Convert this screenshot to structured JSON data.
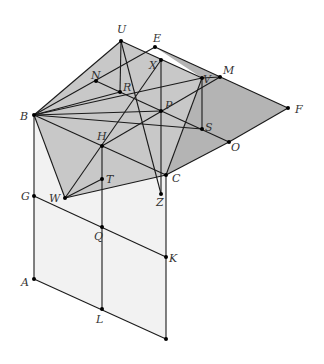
{
  "diagram": {
    "type": "3d-geometry-figure",
    "colors": {
      "line": "#1a1a1a",
      "upper_face": "#c8c8c8",
      "right_face": "#b4b4b4",
      "lower_face": "#f2f2f2",
      "point": "#000000",
      "label": "#333333"
    },
    "points": [
      {
        "id": "U",
        "x": 121,
        "y": 41,
        "lx": 117,
        "ly": 33
      },
      {
        "id": "E",
        "x": 155,
        "y": 47,
        "lx": 153,
        "ly": 42
      },
      {
        "id": "X",
        "x": 161,
        "y": 60,
        "lx": 149,
        "ly": 69
      },
      {
        "id": "N",
        "x": 96,
        "y": 81,
        "lx": 91,
        "ly": 79
      },
      {
        "id": "R",
        "x": 120,
        "y": 92,
        "lx": 123,
        "ly": 91
      },
      {
        "id": "V",
        "x": 202,
        "y": 78,
        "lx": 203,
        "ly": 83
      },
      {
        "id": "M",
        "x": 220,
        "y": 77,
        "lx": 223,
        "ly": 74
      },
      {
        "id": "B",
        "x": 34,
        "y": 115,
        "lx": 20,
        "ly": 120
      },
      {
        "id": "P",
        "x": 161,
        "y": 111,
        "lx": 165,
        "ly": 109
      },
      {
        "id": "F",
        "x": 288,
        "y": 108,
        "lx": 295,
        "ly": 113
      },
      {
        "id": "S",
        "x": 202,
        "y": 129,
        "lx": 205,
        "ly": 131
      },
      {
        "id": "O",
        "x": 229,
        "y": 142,
        "lx": 231,
        "ly": 151
      },
      {
        "id": "H",
        "x": 102,
        "y": 146,
        "lx": 97,
        "ly": 140
      },
      {
        "id": "C",
        "x": 166,
        "y": 175,
        "lx": 172,
        "ly": 182
      },
      {
        "id": "T",
        "x": 102,
        "y": 179,
        "lx": 106,
        "ly": 183
      },
      {
        "id": "W",
        "x": 65,
        "y": 198,
        "lx": 49,
        "ly": 202
      },
      {
        "id": "Z",
        "x": 161,
        "y": 194,
        "lx": 156,
        "ly": 206
      },
      {
        "id": "G",
        "x": 34,
        "y": 196,
        "lx": 21,
        "ly": 200
      },
      {
        "id": "Q",
        "x": 102,
        "y": 227,
        "lx": 94,
        "ly": 240
      },
      {
        "id": "K",
        "x": 166,
        "y": 257,
        "lx": 169,
        "ly": 262
      },
      {
        "id": "A",
        "x": 34,
        "y": 279,
        "lx": 21,
        "ly": 286
      },
      {
        "id": "L",
        "x": 102,
        "y": 309,
        "lx": 96,
        "ly": 323
      },
      {
        "id": "",
        "x": 166,
        "y": 339,
        "lx": 0,
        "ly": 0
      }
    ],
    "faces": [
      {
        "name": "lower-face",
        "pts": "34,115 34,279 166,339 166,175",
        "fill": "lower_face"
      },
      {
        "name": "right-face",
        "pts": "155,47 288,108 229,142 166,175 202,78",
        "fill": "right_face"
      },
      {
        "name": "upper-face",
        "pts": "121,41 202,78 166,175 65,198 34,115",
        "fill": "upper_face"
      }
    ],
    "segments": [
      [
        34,
        115,
        121,
        41
      ],
      [
        121,
        41,
        202,
        78
      ],
      [
        202,
        78,
        220,
        77
      ],
      [
        155,
        47,
        288,
        108
      ],
      [
        288,
        108,
        229,
        142
      ],
      [
        229,
        142,
        166,
        175
      ],
      [
        34,
        115,
        65,
        198
      ],
      [
        65,
        198,
        166,
        175
      ],
      [
        166,
        175,
        202,
        78
      ],
      [
        34,
        115,
        155,
        47
      ],
      [
        96,
        81,
        229,
        142
      ],
      [
        34,
        115,
        166,
        175
      ],
      [
        34,
        115,
        202,
        129
      ],
      [
        34,
        115,
        120,
        92
      ],
      [
        34,
        115,
        202,
        78
      ],
      [
        34,
        115,
        161,
        111
      ],
      [
        65,
        198,
        161,
        60
      ],
      [
        102,
        146,
        220,
        77
      ],
      [
        121,
        41,
        161,
        194
      ],
      [
        161,
        60,
        161,
        194
      ],
      [
        121,
        41,
        120,
        92
      ],
      [
        202,
        78,
        202,
        129
      ],
      [
        102,
        146,
        102,
        309
      ],
      [
        65,
        198,
        102,
        179
      ],
      [
        34,
        115,
        34,
        279
      ],
      [
        34,
        196,
        166,
        257
      ],
      [
        34,
        279,
        166,
        339
      ],
      [
        166,
        175,
        166,
        339
      ]
    ]
  }
}
